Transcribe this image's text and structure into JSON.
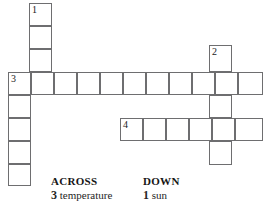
{
  "puzzle": {
    "type": "crossword-grid",
    "cell_size": 23,
    "border_color": "#6e6e70",
    "cell_fill": "#ffffff",
    "entries": [
      {
        "number": "1",
        "direction": "down",
        "start_x": 29,
        "start_y": 3,
        "length": 3,
        "note": "top vertical column, third cell merges into across-row 3"
      },
      {
        "number": "2",
        "direction": "down",
        "start_x": 209,
        "start_y": 45,
        "length": 5,
        "note": "right vertical column crossing rows 3 and 4"
      },
      {
        "number": "3",
        "direction": "across",
        "start_x": 8,
        "start_y": 72,
        "length": 11,
        "note": "long horizontal row"
      },
      {
        "number": "4",
        "direction": "across",
        "start_x": 120,
        "start_y": 118,
        "length": 6,
        "note": "lower horizontal row"
      },
      {
        "number": "",
        "direction": "down",
        "start_x": 8,
        "start_y": 95,
        "length": 4,
        "note": "left vertical column continuing below row 3"
      }
    ],
    "numbers": [
      "1",
      "2",
      "3",
      "4"
    ]
  },
  "clues": {
    "across": {
      "heading": "ACROSS",
      "items": [
        {
          "number": "3",
          "text": "temperature"
        }
      ]
    },
    "down": {
      "heading": "DOWN",
      "items": [
        {
          "number": "1",
          "text": "sun"
        }
      ]
    }
  }
}
